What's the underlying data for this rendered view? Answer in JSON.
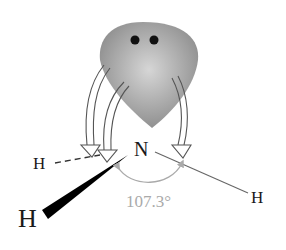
{
  "diagram": {
    "central_atom": "N",
    "atoms": {
      "h_dashed": "H",
      "h_wedge": "H",
      "h_line": "H"
    },
    "bond_angle": "107.3°",
    "lone_pair": {
      "electrons": 2,
      "label": "lone pair"
    },
    "colors": {
      "lobe_dark": "#8a8a8a",
      "lobe_light": "#d0d0d0",
      "text": "#1a1a1a",
      "angle": "#aaaaaa",
      "arrow_stroke": "#555555"
    }
  }
}
